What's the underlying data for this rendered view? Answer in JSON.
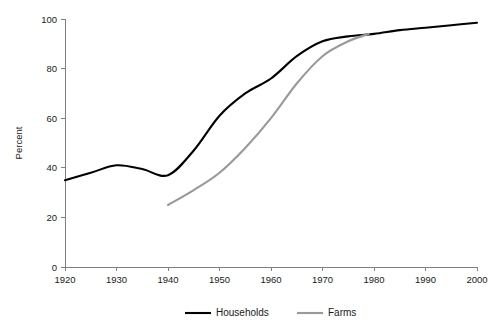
{
  "chart_data": {
    "type": "line",
    "title": "",
    "xlabel": "",
    "ylabel": "Percent",
    "xlim": [
      1920,
      2000
    ],
    "ylim": [
      0,
      100
    ],
    "xticks": [
      1920,
      1930,
      1940,
      1950,
      1960,
      1970,
      1980,
      1990,
      2000
    ],
    "yticks": [
      0,
      20,
      40,
      60,
      80,
      100
    ],
    "grid": false,
    "legend_position": "bottom",
    "series": [
      {
        "name": "Households",
        "color": "#000000",
        "width": 2.1,
        "x": [
          1920,
          1925,
          1930,
          1935,
          1940,
          1945,
          1950,
          1955,
          1960,
          1965,
          1970,
          1975,
          1980,
          1985,
          1990,
          1995,
          2000
        ],
        "values": [
          35,
          38,
          41,
          39.5,
          37,
          47,
          61,
          70,
          76,
          85,
          91,
          93,
          94,
          95.5,
          96.5,
          97.5,
          98.5
        ]
      },
      {
        "name": "Farms",
        "color": "#999999",
        "width": 2.1,
        "x": [
          1940,
          1945,
          1950,
          1955,
          1960,
          1965,
          1970,
          1975,
          1979
        ],
        "values": [
          25,
          31,
          38,
          48,
          60,
          74,
          85,
          91,
          94
        ]
      }
    ]
  },
  "legend": {
    "items": [
      {
        "label": "Households",
        "color": "#000000"
      },
      {
        "label": "Farms",
        "color": "#999999"
      }
    ]
  }
}
